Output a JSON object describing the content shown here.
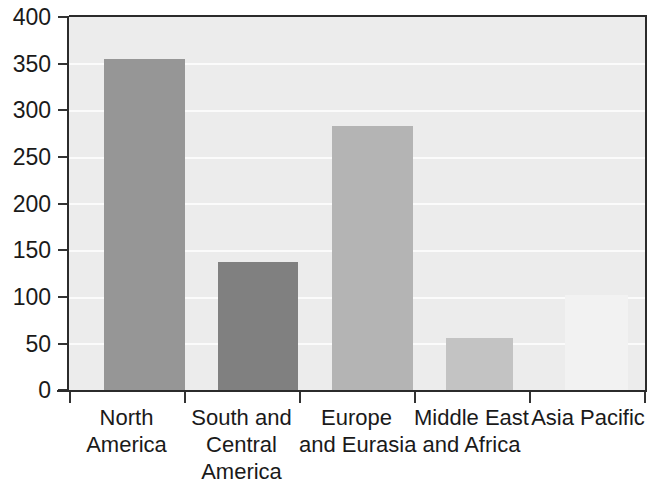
{
  "chart_data": {
    "type": "bar",
    "title": "",
    "subtitle": "",
    "xlabel": "",
    "ylabel": "",
    "ylim": [
      0,
      400
    ],
    "yticks": [
      0,
      50,
      100,
      150,
      200,
      250,
      300,
      350,
      400
    ],
    "ytick_labels": [
      "0",
      "50",
      "100",
      "150",
      "200",
      "250",
      "300",
      "350",
      "400"
    ],
    "grid": true,
    "grid_axis": "y",
    "legend": false,
    "categories": [
      "North America",
      "South and Central America",
      "Europe and Eurasia",
      "Middle East and Africa",
      "Asia Pacific"
    ],
    "category_lines": [
      [
        "North",
        "America"
      ],
      [
        "South and",
        "Central",
        "America"
      ],
      [
        "Europe",
        "and Eurasia"
      ],
      [
        "Middle East",
        "and Africa"
      ],
      [
        "Asia Pacific"
      ]
    ],
    "values": [
      355,
      137,
      283,
      56,
      102
    ],
    "bar_colors": [
      "#969696",
      "#808080",
      "#b4b4b4",
      "#c3c3c3",
      "#f2f2f2"
    ],
    "plot_background": "#ececec",
    "gridline_color": "#fbfbfb",
    "axis_color": "#2b2b2b"
  }
}
